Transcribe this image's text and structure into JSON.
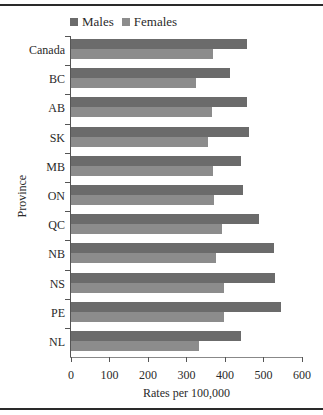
{
  "chart_data": {
    "type": "bar",
    "orientation": "horizontal",
    "title": "",
    "xlabel": "Rates per 100,000",
    "ylabel": "Province",
    "xlim": [
      0,
      600
    ],
    "xticks": [
      0,
      100,
      200,
      300,
      400,
      500,
      600
    ],
    "grid": false,
    "legend_position": "top-left",
    "categories": [
      "Canada",
      "BC",
      "AB",
      "SK",
      "MB",
      "ON",
      "QC",
      "NB",
      "NS",
      "PE",
      "NL"
    ],
    "series": [
      {
        "name": "Males",
        "color": "#6b6b6b",
        "values": [
          457,
          413,
          456,
          462,
          441,
          447,
          488,
          526,
          531,
          545,
          442
        ]
      },
      {
        "name": "Females",
        "color": "#8c8c8c",
        "values": [
          368,
          324,
          367,
          356,
          370,
          371,
          393,
          377,
          397,
          397,
          332
        ]
      }
    ]
  },
  "legend": {
    "males": "Males",
    "females": "Females"
  },
  "axes": {
    "x_title": "Rates per 100,000",
    "y_title": "Province"
  }
}
